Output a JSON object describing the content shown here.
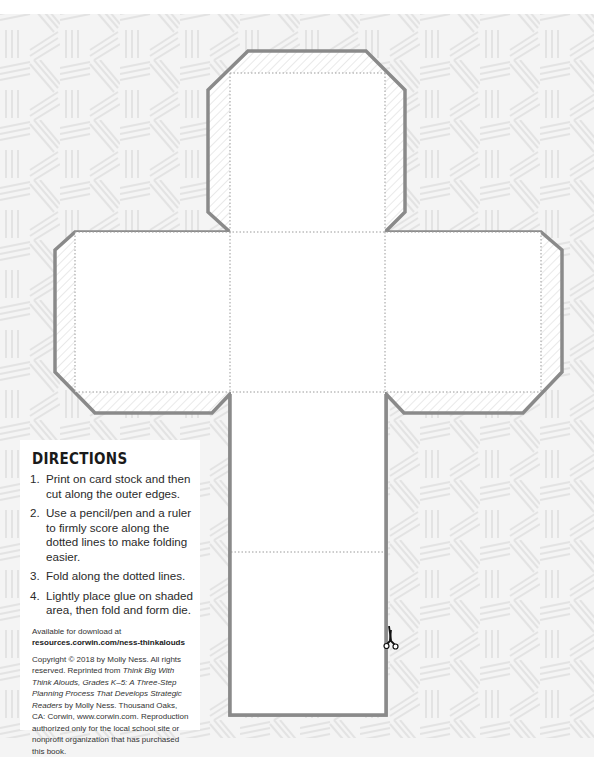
{
  "page": {
    "colors": {
      "background": "#f4f4f4",
      "pattern": "#e6e6e6",
      "cut_line": "#8a8a8a",
      "fold_line": "#9a9a9a",
      "face_fill": "#ffffff"
    }
  },
  "die": {
    "cut_line_label": "outer edges",
    "fold_line_label": "dotted lines",
    "scissors_icon": "scissors-icon"
  },
  "directions": {
    "heading": "DIRECTIONS",
    "steps": [
      {
        "num": "1.",
        "text": "Print on card stock and then cut along the outer edges."
      },
      {
        "num": "2.",
        "text": "Use a pencil/pen and a ruler to firmly score along the dotted lines to make folding easier."
      },
      {
        "num": "3.",
        "text": "Fold along the dotted lines."
      },
      {
        "num": "4.",
        "text": "Lightly place glue on shaded area, then fold and form die."
      }
    ],
    "available_label": "Available for download at",
    "available_url": "resources.corwin.com/ness-thinkalouds",
    "copyright_1": "Copyright © 2018 by Molly Ness. All rights reserved. Reprinted from ",
    "copyright_book": "Think Big With Think Alouds, Grades K–5: A Three-Step Planning Process That Develops Strategic Readers",
    "copyright_2": " by Molly Ness. Thousand Oaks, CA: Corwin, www.corwin.com. Reproduction authorized only for the local school site or nonprofit organization that has purchased this book."
  }
}
